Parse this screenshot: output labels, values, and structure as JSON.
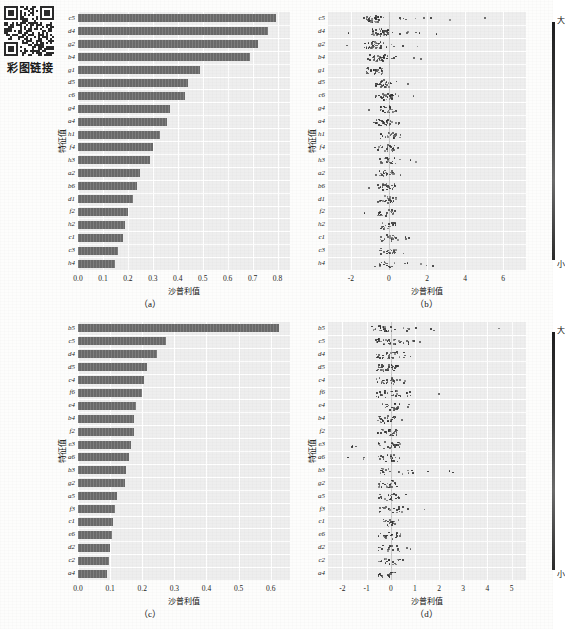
{
  "qr": {
    "caption": "彩图链接",
    "icon": "qr-code-icon"
  },
  "top_bleed_text": "",
  "labels": {
    "xaxis_title": "沙普利值",
    "yaxis_title": "特征值",
    "colorbar_high": "大",
    "colorbar_low": "小"
  },
  "panels": [
    {
      "id": "a",
      "caption": "（a）"
    },
    {
      "id": "b",
      "caption": "（b）"
    },
    {
      "id": "c",
      "caption": "（c）"
    },
    {
      "id": "d",
      "caption": "（d）"
    }
  ],
  "chart_data": [
    {
      "type": "bar",
      "panel": "a",
      "title": "",
      "xlabel": "沙普利值",
      "ylabel": "特征值",
      "xlim": [
        0,
        0.85
      ],
      "xticks": [
        "0.0",
        "0.1",
        "0.2",
        "0.3",
        "0.4",
        "0.5",
        "0.6",
        "0.7",
        "0.8"
      ],
      "xtick_values": [
        0.0,
        0.1,
        0.2,
        0.3,
        0.4,
        0.5,
        0.6,
        0.7,
        0.8
      ],
      "grid": true,
      "orientation": "horizontal",
      "categories": [
        "c5",
        "d4",
        "g2",
        "b4",
        "g1",
        "d5",
        "c6",
        "g4",
        "a4",
        "h1",
        "f4",
        "h3",
        "a2",
        "b6",
        "d1",
        "f2",
        "h2",
        "c1",
        "c3",
        "h4"
      ],
      "values": [
        0.795,
        0.76,
        0.72,
        0.69,
        0.49,
        0.44,
        0.43,
        0.37,
        0.355,
        0.33,
        0.3,
        0.29,
        0.25,
        0.235,
        0.22,
        0.2,
        0.19,
        0.18,
        0.16,
        0.15
      ]
    },
    {
      "type": "scatter",
      "panel": "b",
      "subtype": "beeswarm",
      "title": "",
      "xlabel": "沙普利值",
      "ylabel": "特征值",
      "xlim": [
        -3.2,
        7.2
      ],
      "xticks": [
        "-2",
        "0",
        "2",
        "4",
        "6"
      ],
      "xtick_values": [
        -2,
        0,
        2,
        4,
        6
      ],
      "grid": true,
      "colorbar": {
        "high": "大",
        "low": "小"
      },
      "categories": [
        "c5",
        "d4",
        "g2",
        "b4",
        "g1",
        "d5",
        "c6",
        "g4",
        "a4",
        "h1",
        "f4",
        "h3",
        "a2",
        "b6",
        "d1",
        "f2",
        "h2",
        "c1",
        "c3",
        "h4"
      ],
      "series": [
        {
          "name": "c5",
          "spread": [
            -1.3,
            6.4
          ],
          "center": -0.9,
          "density": 42
        },
        {
          "name": "d4",
          "spread": [
            -2.6,
            4.2
          ],
          "center": -0.5,
          "density": 44
        },
        {
          "name": "g2",
          "spread": [
            -3.0,
            1.6
          ],
          "center": -0.9,
          "density": 40
        },
        {
          "name": "b4",
          "spread": [
            -1.2,
            1.8
          ],
          "center": -0.7,
          "density": 36
        },
        {
          "name": "g1",
          "spread": [
            -1.4,
            0.4
          ],
          "center": -0.8,
          "density": 30
        },
        {
          "name": "d5",
          "spread": [
            -1.5,
            1.2
          ],
          "center": -0.3,
          "density": 32
        },
        {
          "name": "c6",
          "spread": [
            -1.1,
            1.4
          ],
          "center": -0.3,
          "density": 34
        },
        {
          "name": "g4",
          "spread": [
            -2.2,
            0.2
          ],
          "center": -0.1,
          "density": 26
        },
        {
          "name": "a4",
          "spread": [
            -1.4,
            2.0
          ],
          "center": -0.4,
          "density": 32
        },
        {
          "name": "h1",
          "spread": [
            -0.4,
            1.4
          ],
          "center": -0.1,
          "density": 24
        },
        {
          "name": "f4",
          "spread": [
            -0.9,
            1.6
          ],
          "center": -0.2,
          "density": 28
        },
        {
          "name": "h3",
          "spread": [
            -0.6,
            2.6
          ],
          "center": -0.1,
          "density": 22
        },
        {
          "name": "a2",
          "spread": [
            -2.4,
            0.8
          ],
          "center": -0.2,
          "density": 26
        },
        {
          "name": "b6",
          "spread": [
            -1.4,
            1.2
          ],
          "center": -0.2,
          "density": 26
        },
        {
          "name": "d1",
          "spread": [
            -1.0,
            1.0
          ],
          "center": -0.2,
          "density": 24
        },
        {
          "name": "f2",
          "spread": [
            -1.6,
            1.2
          ],
          "center": -0.2,
          "density": 26
        },
        {
          "name": "h2",
          "spread": [
            -0.7,
            0.7
          ],
          "center": -0.1,
          "density": 20
        },
        {
          "name": "c1",
          "spread": [
            -1.0,
            2.6
          ],
          "center": -0.1,
          "density": 22
        },
        {
          "name": "c3",
          "spread": [
            -0.9,
            1.1
          ],
          "center": -0.1,
          "density": 22
        },
        {
          "name": "h4",
          "spread": [
            -1.2,
            4.1
          ],
          "center": -0.1,
          "density": 20
        }
      ]
    },
    {
      "type": "bar",
      "panel": "c",
      "title": "",
      "xlabel": "沙普利值",
      "ylabel": "特征值",
      "xlim": [
        0,
        0.66
      ],
      "xticks": [
        "0.0",
        "0.1",
        "0.2",
        "0.3",
        "0.4",
        "0.5",
        "0.6"
      ],
      "xtick_values": [
        0.0,
        0.1,
        0.2,
        0.3,
        0.4,
        0.5,
        0.6
      ],
      "grid": true,
      "orientation": "horizontal",
      "categories": [
        "b5",
        "c5",
        "d4",
        "d5",
        "c4",
        "f6",
        "e4",
        "b4",
        "f2",
        "e3",
        "a6",
        "b3",
        "g2",
        "a5",
        "f3",
        "c1",
        "e6",
        "d2",
        "c2",
        "a4"
      ],
      "values": [
        0.625,
        0.275,
        0.245,
        0.215,
        0.205,
        0.2,
        0.18,
        0.175,
        0.175,
        0.165,
        0.16,
        0.15,
        0.145,
        0.12,
        0.115,
        0.11,
        0.105,
        0.1,
        0.095,
        0.09
      ]
    },
    {
      "type": "scatter",
      "panel": "d",
      "subtype": "beeswarm",
      "title": "",
      "xlabel": "沙普利值",
      "ylabel": "特征值",
      "xlim": [
        -2.6,
        5.6
      ],
      "xticks": [
        "-2",
        "-1",
        "0",
        "1",
        "2",
        "3",
        "4",
        "5"
      ],
      "xtick_values": [
        -2,
        -1,
        0,
        1,
        2,
        3,
        4,
        5
      ],
      "grid": true,
      "colorbar": {
        "high": "大",
        "low": "小"
      },
      "categories": [
        "b5",
        "c5",
        "d4",
        "d5",
        "c4",
        "f6",
        "e4",
        "b4",
        "f2",
        "e3",
        "a6",
        "b3",
        "g2",
        "a5",
        "f3",
        "c1",
        "e6",
        "d2",
        "c2",
        "a4"
      ],
      "series": [
        {
          "name": "b5",
          "spread": [
            -0.5,
            5.0
          ],
          "center": -0.4,
          "density": 34
        },
        {
          "name": "c5",
          "spread": [
            -0.6,
            2.6
          ],
          "center": -0.3,
          "density": 36
        },
        {
          "name": "d4",
          "spread": [
            -0.4,
            1.6
          ],
          "center": -0.2,
          "density": 30
        },
        {
          "name": "d5",
          "spread": [
            -0.5,
            1.0
          ],
          "center": -0.2,
          "density": 30
        },
        {
          "name": "c4",
          "spread": [
            -0.6,
            1.8
          ],
          "center": -0.2,
          "density": 26
        },
        {
          "name": "f6",
          "spread": [
            -0.5,
            2.1
          ],
          "center": -0.2,
          "density": 30
        },
        {
          "name": "e4",
          "spread": [
            -0.4,
            0.8
          ],
          "center": -0.1,
          "density": 24
        },
        {
          "name": "b4",
          "spread": [
            -0.5,
            1.0
          ],
          "center": -0.2,
          "density": 26
        },
        {
          "name": "f2",
          "spread": [
            -1.0,
            0.7
          ],
          "center": -0.2,
          "density": 28
        },
        {
          "name": "e3",
          "spread": [
            -1.8,
            0.6
          ],
          "center": -0.1,
          "density": 26
        },
        {
          "name": "a6",
          "spread": [
            -2.4,
            0.6
          ],
          "center": -0.1,
          "density": 24
        },
        {
          "name": "b3",
          "spread": [
            -0.5,
            2.9
          ],
          "center": -0.1,
          "density": 22
        },
        {
          "name": "g2",
          "spread": [
            -0.9,
            0.9
          ],
          "center": -0.1,
          "density": 24
        },
        {
          "name": "a5",
          "spread": [
            -0.6,
            1.5
          ],
          "center": -0.1,
          "density": 22
        },
        {
          "name": "f3",
          "spread": [
            -0.8,
            1.7
          ],
          "center": -0.1,
          "density": 22
        },
        {
          "name": "c1",
          "spread": [
            -0.5,
            1.1
          ],
          "center": -0.1,
          "density": 20
        },
        {
          "name": "e6",
          "spread": [
            -0.6,
            0.9
          ],
          "center": -0.1,
          "density": 20
        },
        {
          "name": "d2",
          "spread": [
            -0.5,
            1.6
          ],
          "center": -0.1,
          "density": 20
        },
        {
          "name": "c2",
          "spread": [
            -0.6,
            0.8
          ],
          "center": -0.1,
          "density": 18
        },
        {
          "name": "a4",
          "spread": [
            -0.7,
            0.6
          ],
          "center": -0.1,
          "density": 18
        }
      ]
    }
  ]
}
